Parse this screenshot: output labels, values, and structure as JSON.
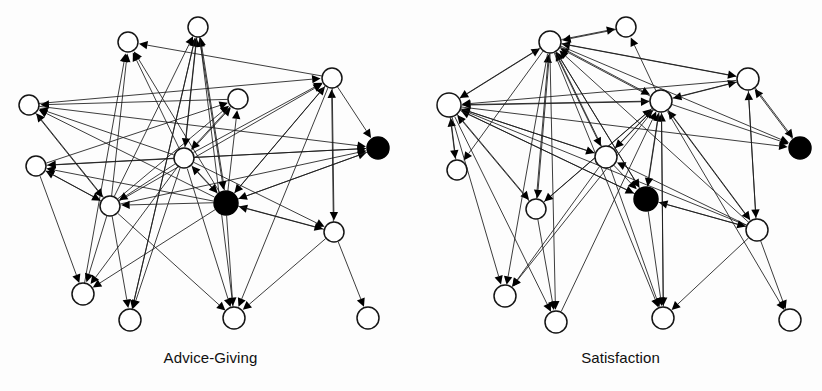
{
  "figure": {
    "title": "",
    "background_color": "#fdfdfd",
    "node_open_color": "#ffffff",
    "node_filled_color": "#000000",
    "edge_color": "#1a1a1a",
    "panel_count": 2
  },
  "panels": [
    {
      "id": "advice-giving",
      "caption": "Advice-Giving",
      "node_count": 15,
      "nodes": [
        {
          "id": "L1",
          "x": 128,
          "y": 42,
          "r": 10,
          "fill": "open"
        },
        {
          "id": "L2",
          "x": 198,
          "y": 27,
          "r": 10,
          "fill": "open"
        },
        {
          "id": "L3",
          "x": 332,
          "y": 78,
          "r": 10,
          "fill": "open"
        },
        {
          "id": "L4",
          "x": 238,
          "y": 99,
          "r": 10,
          "fill": "open"
        },
        {
          "id": "L5",
          "x": 29,
          "y": 105,
          "r": 10,
          "fill": "open"
        },
        {
          "id": "L6",
          "x": 378,
          "y": 148,
          "r": 11,
          "fill": "filled"
        },
        {
          "id": "L7",
          "x": 184,
          "y": 158,
          "r": 10,
          "fill": "open"
        },
        {
          "id": "L8",
          "x": 36,
          "y": 166,
          "r": 10,
          "fill": "open"
        },
        {
          "id": "L9",
          "x": 226,
          "y": 203,
          "r": 12,
          "fill": "filled"
        },
        {
          "id": "L10",
          "x": 110,
          "y": 206,
          "r": 10,
          "fill": "open"
        },
        {
          "id": "L11",
          "x": 334,
          "y": 232,
          "r": 10,
          "fill": "open"
        },
        {
          "id": "L12",
          "x": 83,
          "y": 294,
          "r": 11,
          "fill": "open"
        },
        {
          "id": "L13",
          "x": 130,
          "y": 320,
          "r": 11,
          "fill": "open"
        },
        {
          "id": "L14",
          "x": 234,
          "y": 318,
          "r": 11,
          "fill": "open"
        },
        {
          "id": "L15",
          "x": 368,
          "y": 318,
          "r": 11,
          "fill": "open"
        }
      ],
      "edges": [
        {
          "from": "L3",
          "to": "L1"
        },
        {
          "from": "L7",
          "to": "L1"
        },
        {
          "from": "L9",
          "to": "L1"
        },
        {
          "from": "L10",
          "to": "L1"
        },
        {
          "from": "L12",
          "to": "L1"
        },
        {
          "from": "L7",
          "to": "L2"
        },
        {
          "from": "L9",
          "to": "L2"
        },
        {
          "from": "L10",
          "to": "L2"
        },
        {
          "from": "L13",
          "to": "L2"
        },
        {
          "from": "L14",
          "to": "L2"
        },
        {
          "from": "L7",
          "to": "L3"
        },
        {
          "from": "L9",
          "to": "L3"
        },
        {
          "from": "L10",
          "to": "L3"
        },
        {
          "from": "L11",
          "to": "L3"
        },
        {
          "from": "L5",
          "to": "L3"
        },
        {
          "from": "L7",
          "to": "L4"
        },
        {
          "from": "L9",
          "to": "L4"
        },
        {
          "from": "L8",
          "to": "L4"
        },
        {
          "from": "L10",
          "to": "L4"
        },
        {
          "from": "L7",
          "to": "L5"
        },
        {
          "from": "L9",
          "to": "L5"
        },
        {
          "from": "L10",
          "to": "L5"
        },
        {
          "from": "L4",
          "to": "L5"
        },
        {
          "from": "L3",
          "to": "L6"
        },
        {
          "from": "L7",
          "to": "L6"
        },
        {
          "from": "L9",
          "to": "L6"
        },
        {
          "from": "L8",
          "to": "L6"
        },
        {
          "from": "L10",
          "to": "L6"
        },
        {
          "from": "L5",
          "to": "L6"
        },
        {
          "from": "L4",
          "to": "L7"
        },
        {
          "from": "L9",
          "to": "L7"
        },
        {
          "from": "L2",
          "to": "L7"
        },
        {
          "from": "L10",
          "to": "L8"
        },
        {
          "from": "L7",
          "to": "L8"
        },
        {
          "from": "L9",
          "to": "L8"
        },
        {
          "from": "L11",
          "to": "L9"
        },
        {
          "from": "L7",
          "to": "L9"
        },
        {
          "from": "L3",
          "to": "L9"
        },
        {
          "from": "L6",
          "to": "L9"
        },
        {
          "from": "L2",
          "to": "L9"
        },
        {
          "from": "L9",
          "to": "L10"
        },
        {
          "from": "L7",
          "to": "L10"
        },
        {
          "from": "L8",
          "to": "L10"
        },
        {
          "from": "L5",
          "to": "L10"
        },
        {
          "from": "L9",
          "to": "L11"
        },
        {
          "from": "L7",
          "to": "L11"
        },
        {
          "from": "L3",
          "to": "L11"
        },
        {
          "from": "L8",
          "to": "L12"
        },
        {
          "from": "L10",
          "to": "L12"
        },
        {
          "from": "L7",
          "to": "L12"
        },
        {
          "from": "L9",
          "to": "L12"
        },
        {
          "from": "L10",
          "to": "L13"
        },
        {
          "from": "L7",
          "to": "L13"
        },
        {
          "from": "L2",
          "to": "L13"
        },
        {
          "from": "L9",
          "to": "L14"
        },
        {
          "from": "L7",
          "to": "L14"
        },
        {
          "from": "L10",
          "to": "L14"
        },
        {
          "from": "L11",
          "to": "L14"
        },
        {
          "from": "L3",
          "to": "L14"
        },
        {
          "from": "L11",
          "to": "L15"
        }
      ]
    },
    {
      "id": "satisfaction",
      "caption": "Satisfaction",
      "node_count": 15,
      "nodes": [
        {
          "id": "R1",
          "x": 626,
          "y": 27,
          "r": 10,
          "fill": "open"
        },
        {
          "id": "R2",
          "x": 550,
          "y": 42,
          "r": 11,
          "fill": "open"
        },
        {
          "id": "R3",
          "x": 748,
          "y": 79,
          "r": 11,
          "fill": "open"
        },
        {
          "id": "R4",
          "x": 661,
          "y": 101,
          "r": 11,
          "fill": "open"
        },
        {
          "id": "R5",
          "x": 449,
          "y": 105,
          "r": 12,
          "fill": "open"
        },
        {
          "id": "R6",
          "x": 800,
          "y": 148,
          "r": 11,
          "fill": "filled"
        },
        {
          "id": "R7",
          "x": 606,
          "y": 157,
          "r": 11,
          "fill": "open"
        },
        {
          "id": "R8",
          "x": 457,
          "y": 170,
          "r": 10,
          "fill": "open"
        },
        {
          "id": "R9",
          "x": 646,
          "y": 199,
          "r": 12,
          "fill": "filled"
        },
        {
          "id": "R10",
          "x": 536,
          "y": 209,
          "r": 10,
          "fill": "open"
        },
        {
          "id": "R11",
          "x": 757,
          "y": 230,
          "r": 11,
          "fill": "open"
        },
        {
          "id": "R12",
          "x": 505,
          "y": 296,
          "r": 11,
          "fill": "open"
        },
        {
          "id": "R13",
          "x": 556,
          "y": 322,
          "r": 11,
          "fill": "open"
        },
        {
          "id": "R14",
          "x": 663,
          "y": 318,
          "r": 11,
          "fill": "open"
        },
        {
          "id": "R15",
          "x": 790,
          "y": 320,
          "r": 11,
          "fill": "open"
        }
      ],
      "edges": [
        {
          "from": "R2",
          "to": "R1"
        },
        {
          "from": "R4",
          "to": "R1"
        },
        {
          "from": "R5",
          "to": "R2"
        },
        {
          "from": "R1",
          "to": "R2"
        },
        {
          "from": "R4",
          "to": "R2"
        },
        {
          "from": "R3",
          "to": "R2"
        },
        {
          "from": "R7",
          "to": "R2"
        },
        {
          "from": "R9",
          "to": "R2"
        },
        {
          "from": "R10",
          "to": "R2"
        },
        {
          "from": "R11",
          "to": "R2"
        },
        {
          "from": "R2",
          "to": "R3"
        },
        {
          "from": "R4",
          "to": "R3"
        },
        {
          "from": "R11",
          "to": "R3"
        },
        {
          "from": "R6",
          "to": "R3"
        },
        {
          "from": "R2",
          "to": "R4"
        },
        {
          "from": "R3",
          "to": "R4"
        },
        {
          "from": "R5",
          "to": "R4"
        },
        {
          "from": "R7",
          "to": "R4"
        },
        {
          "from": "R9",
          "to": "R4"
        },
        {
          "from": "R10",
          "to": "R4"
        },
        {
          "from": "R11",
          "to": "R4"
        },
        {
          "from": "R13",
          "to": "R4"
        },
        {
          "from": "R14",
          "to": "R4"
        },
        {
          "from": "R2",
          "to": "R5"
        },
        {
          "from": "R4",
          "to": "R5"
        },
        {
          "from": "R3",
          "to": "R5"
        },
        {
          "from": "R7",
          "to": "R5"
        },
        {
          "from": "R9",
          "to": "R5"
        },
        {
          "from": "R10",
          "to": "R5"
        },
        {
          "from": "R11",
          "to": "R5"
        },
        {
          "from": "R8",
          "to": "R5"
        },
        {
          "from": "R4",
          "to": "R6"
        },
        {
          "from": "R2",
          "to": "R6"
        },
        {
          "from": "R3",
          "to": "R6"
        },
        {
          "from": "R5",
          "to": "R6"
        },
        {
          "from": "R2",
          "to": "R7"
        },
        {
          "from": "R4",
          "to": "R7"
        },
        {
          "from": "R5",
          "to": "R7"
        },
        {
          "from": "R11",
          "to": "R7"
        },
        {
          "from": "R5",
          "to": "R8"
        },
        {
          "from": "R2",
          "to": "R8"
        },
        {
          "from": "R4",
          "to": "R9"
        },
        {
          "from": "R2",
          "to": "R9"
        },
        {
          "from": "R5",
          "to": "R9"
        },
        {
          "from": "R7",
          "to": "R9"
        },
        {
          "from": "R11",
          "to": "R9"
        },
        {
          "from": "R5",
          "to": "R10"
        },
        {
          "from": "R2",
          "to": "R10"
        },
        {
          "from": "R4",
          "to": "R10"
        },
        {
          "from": "R4",
          "to": "R11"
        },
        {
          "from": "R3",
          "to": "R11"
        },
        {
          "from": "R9",
          "to": "R11"
        },
        {
          "from": "R5",
          "to": "R12"
        },
        {
          "from": "R2",
          "to": "R12"
        },
        {
          "from": "R4",
          "to": "R12"
        },
        {
          "from": "R7",
          "to": "R12"
        },
        {
          "from": "R5",
          "to": "R13"
        },
        {
          "from": "R2",
          "to": "R13"
        },
        {
          "from": "R10",
          "to": "R13"
        },
        {
          "from": "R4",
          "to": "R14"
        },
        {
          "from": "R7",
          "to": "R14"
        },
        {
          "from": "R2",
          "to": "R14"
        },
        {
          "from": "R11",
          "to": "R14"
        },
        {
          "from": "R9",
          "to": "R14"
        },
        {
          "from": "R11",
          "to": "R15"
        },
        {
          "from": "R4",
          "to": "R15"
        }
      ]
    }
  ]
}
